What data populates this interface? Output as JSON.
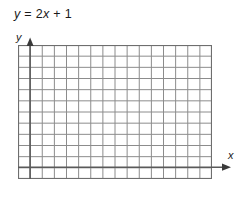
{
  "figure": {
    "equation": {
      "lhs": "y",
      "eq": " = ",
      "coef": "2",
      "xvar": "x",
      "plus": " + ",
      "constant": "1",
      "full_text": "y = 2x + 1"
    },
    "axes": {
      "y_label": "y",
      "x_label": "x",
      "y_arrow_icon": "arrow-up-icon",
      "x_arrow_icon": "arrow-right-icon"
    },
    "colors": {
      "background": "#ffffff",
      "grid_line": "#8c8c8c",
      "grid_border": "#6e6e6e",
      "axis_line": "#5a5a5a",
      "text": "#1a1a1a"
    }
  },
  "chart_data": {
    "type": "line",
    "title": "y = 2x + 1",
    "xlabel": "x",
    "ylabel": "y",
    "grid": true,
    "grid_columns": 16,
    "grid_rows": 12,
    "cell_size_px": 12.125,
    "xlim": [
      -1,
      15
    ],
    "ylim": [
      -1,
      11
    ],
    "x_axis_row_from_bottom": 1,
    "y_axis_col_from_left": 1,
    "legend": null,
    "annotations": [
      "y = 2x + 1"
    ],
    "series": [
      {
        "name": "y = 2x + 1",
        "slope": 2,
        "intercept": 1,
        "x": [],
        "values": [],
        "plotted": false
      }
    ],
    "note": "Blank plotting grid; the line y = 2x + 1 is not drawn."
  }
}
